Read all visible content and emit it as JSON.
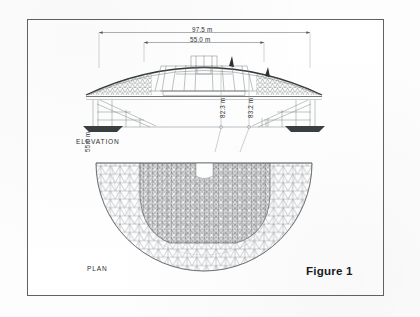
{
  "figure": {
    "caption": "Figure 1",
    "border_color": "#5e6366",
    "ink_color": "#2d3133",
    "page_background": "#ffffff"
  },
  "elevation": {
    "view_label": "ELEVATION",
    "dimensions": [
      {
        "name": "overall-span",
        "value": "97.5 m",
        "orientation": "horizontal"
      },
      {
        "name": "inner-span",
        "value": "55.0 m",
        "orientation": "horizontal"
      },
      {
        "name": "left-height",
        "value": "82.3 m",
        "orientation": "vertical"
      },
      {
        "name": "right-height",
        "value": "83.2 m",
        "orientation": "vertical"
      }
    ]
  },
  "plan": {
    "view_label": "PLAN",
    "radius_label": "55.0 m",
    "mesh_description": "triangulated semicircular lattice"
  }
}
